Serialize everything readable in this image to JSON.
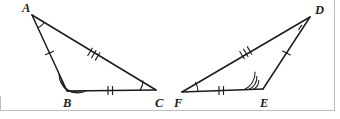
{
  "figure": {
    "caption": "Two congruent triangles with matching side tick marks and angle arcs",
    "background_color": "#ffffff",
    "stroke_color": "#1c1c1c",
    "frame_color": "#bdbdbd"
  },
  "triangles": [
    {
      "id": "triangle-abc",
      "name": "Triangle ABC",
      "vertices": [
        {
          "label": "A",
          "x": 32,
          "y": 15,
          "label_x": 22,
          "label_y": 12
        },
        {
          "label": "B",
          "x": 67,
          "y": 91,
          "label_x": 63,
          "label_y": 107
        },
        {
          "label": "C",
          "x": 156,
          "y": 90,
          "label_x": 155,
          "label_y": 107
        }
      ],
      "sides": [
        {
          "name": "side-AB",
          "from": "A",
          "to": "B",
          "ticks": 1
        },
        {
          "name": "side-BC",
          "from": "B",
          "to": "C",
          "ticks": 2
        },
        {
          "name": "side-AC",
          "from": "A",
          "to": "C",
          "ticks": 3
        }
      ],
      "angles": [
        {
          "name": "angle-A",
          "at": "A",
          "arcs": 1
        },
        {
          "name": "angle-B",
          "at": "B",
          "arcs": 3
        },
        {
          "name": "angle-C",
          "at": "C",
          "arcs": 1
        }
      ]
    },
    {
      "id": "triangle-def",
      "name": "Triangle DEF",
      "vertices": [
        {
          "label": "D",
          "x": 310,
          "y": 17,
          "label_x": 315,
          "label_y": 14
        },
        {
          "label": "E",
          "x": 263,
          "y": 89,
          "label_x": 260,
          "label_y": 107
        },
        {
          "label": "F",
          "x": 182,
          "y": 92,
          "label_x": 174,
          "label_y": 107
        }
      ],
      "sides": [
        {
          "name": "side-DE",
          "from": "D",
          "to": "E",
          "ticks": 1
        },
        {
          "name": "side-FE",
          "from": "F",
          "to": "E",
          "ticks": 2
        },
        {
          "name": "side-DF",
          "from": "D",
          "to": "F",
          "ticks": 3
        }
      ],
      "angles": [
        {
          "name": "angle-D",
          "at": "D",
          "arcs": 1
        },
        {
          "name": "angle-E",
          "at": "E",
          "arcs": 3
        },
        {
          "name": "angle-F",
          "at": "F",
          "arcs": 1
        }
      ]
    }
  ],
  "labels": {
    "a": "A",
    "b": "B",
    "c": "C",
    "d": "D",
    "e": "E",
    "f": "F"
  }
}
